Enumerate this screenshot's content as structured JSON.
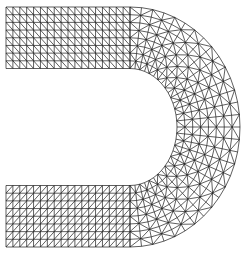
{
  "figure": {
    "background": "#ffffff",
    "line_color": "#1a1a1a",
    "line_width": 0.7,
    "mesh": {
      "rows": 8,
      "straight_columns": 18,
      "arc_segments": 30,
      "straight_x_start": 6,
      "straight_x_end": 130,
      "center": [
        130,
        127
      ],
      "outer_radius": [
        110,
        120
      ],
      "inner_radius": [
        47,
        58.5
      ],
      "top_band_diagonal": "backslash",
      "bottom_band_diagonal": "slash"
    }
  }
}
